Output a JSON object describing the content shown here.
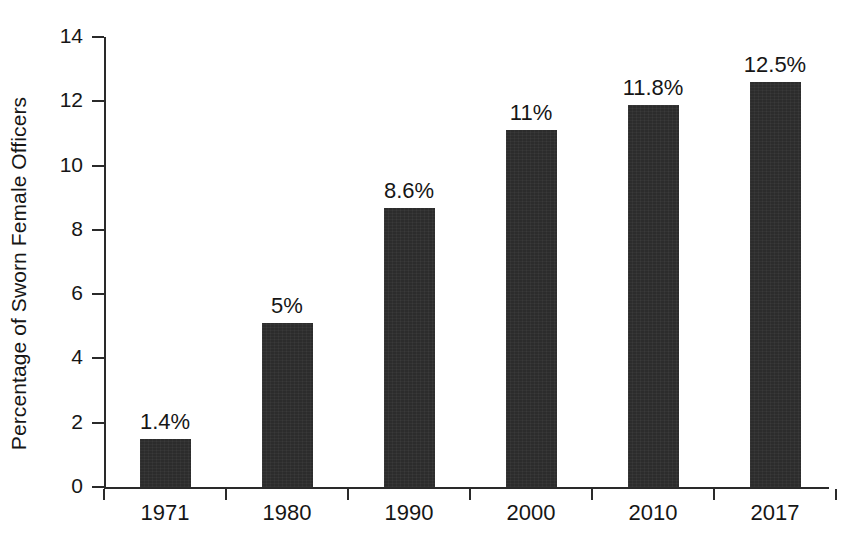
{
  "chart_data": {
    "type": "bar",
    "title": "",
    "subtitle": "",
    "xlabel": "",
    "ylabel": "Percentage of Sworn Female Officers",
    "categories": [
      "1971",
      "1980",
      "1990",
      "2000",
      "2010",
      "2017"
    ],
    "values": [
      1.4,
      5,
      8.6,
      11,
      11.8,
      12.5
    ],
    "value_labels": [
      "1.4%",
      "5%",
      "8.6%",
      "11%",
      "11.8%",
      "12.5%"
    ],
    "ylim": [
      0,
      14
    ],
    "ytick_labels": [
      "0",
      "2",
      "4",
      "6",
      "8",
      "10",
      "12",
      "14"
    ],
    "ytick_values": [
      0,
      2,
      4,
      6,
      8,
      10,
      12,
      14
    ],
    "grid": false,
    "legend": null,
    "bar_color": "#2c2c2c",
    "axis_color": "#2a2a2a",
    "text_color": "#161616",
    "background": "#ffffff"
  }
}
